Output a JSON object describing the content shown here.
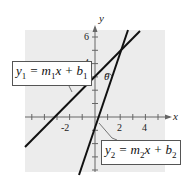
{
  "figure": {
    "axis_x_label": "x",
    "axis_y_label": "y",
    "x_ticks": [
      "-2",
      "2",
      "4"
    ],
    "y_ticks": [
      "4",
      "6"
    ],
    "angle_label": "θ",
    "line1": {
      "equation": "y1 = m1x + b1",
      "y": "y",
      "sub_y": "1",
      "eq": " = m",
      "sub_m": "1",
      "x": "x + b",
      "sub_b": "1"
    },
    "line2": {
      "equation": "y2 = m2x + b2",
      "y": "y",
      "sub_y": "2",
      "eq": " = m",
      "sub_m": "2",
      "x": "x + b",
      "sub_b": "2"
    },
    "colors": {
      "background": "#ebebeb",
      "line": "#111111",
      "axis": "#555555"
    }
  }
}
